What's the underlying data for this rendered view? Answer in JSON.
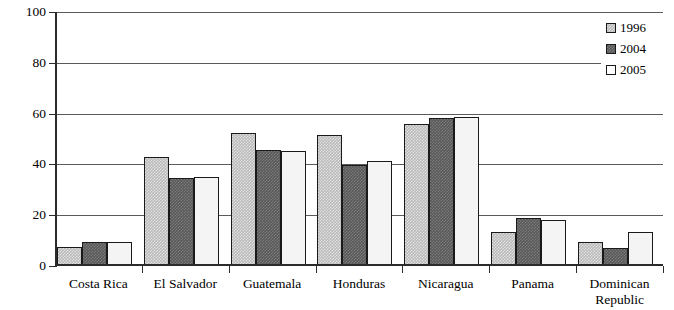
{
  "chart_data": {
    "type": "bar",
    "title": "",
    "xlabel": "",
    "ylabel": "Percentage",
    "ylim": [
      0,
      100
    ],
    "yticks": [
      0,
      20,
      40,
      60,
      80,
      100
    ],
    "ytick_labels": [
      "0",
      "20",
      "40",
      "60",
      "80",
      "100"
    ],
    "grid": true,
    "legend_position": "top-right",
    "categories": [
      "Costa Rica",
      "El Salvador",
      "Guatemala",
      "Honduras",
      "Nicaragua",
      "Panama",
      "Dominican Republic"
    ],
    "series": [
      {
        "name": "1996",
        "color": "#b9b9b9",
        "values": [
          7.3,
          43.0,
          52.3,
          51.5,
          56.0,
          13.5,
          9.5
        ]
      },
      {
        "name": "2004",
        "color": "#585858",
        "values": [
          9.4,
          34.7,
          45.6,
          39.8,
          58.2,
          18.9,
          7.0
        ]
      },
      {
        "name": "2005",
        "color": "#f4f4f4",
        "values": [
          9.5,
          35.0,
          45.4,
          41.3,
          58.6,
          18.0,
          13.5
        ]
      }
    ]
  }
}
